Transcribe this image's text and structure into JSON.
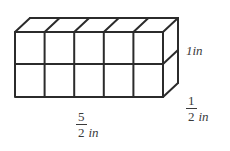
{
  "figure": {
    "name": "rectangular-prism-unit-cubes",
    "background_color": "#ffffff",
    "line_color": "#2b2b2b",
    "line_width": 2,
    "columns": 5,
    "rows": 2,
    "geometry": {
      "front_left_x": 15,
      "front_right_x": 163,
      "front_top_y": 32,
      "front_bottom_y": 97,
      "mid_divider_y": 64,
      "oblique_dx": 15,
      "oblique_dy": -14
    }
  },
  "labels": {
    "height": {
      "text": "1in",
      "number": "1",
      "unit": "in",
      "position": "right-side-vertical-edge"
    },
    "depth": {
      "numerator": "1",
      "denominator": "2",
      "unit": "in",
      "text": "1/2 in",
      "position": "right-side-oblique-edge"
    },
    "length": {
      "numerator": "5",
      "denominator": "2",
      "unit": "in",
      "text": "5/2 in",
      "position": "bottom-front-edge"
    }
  }
}
